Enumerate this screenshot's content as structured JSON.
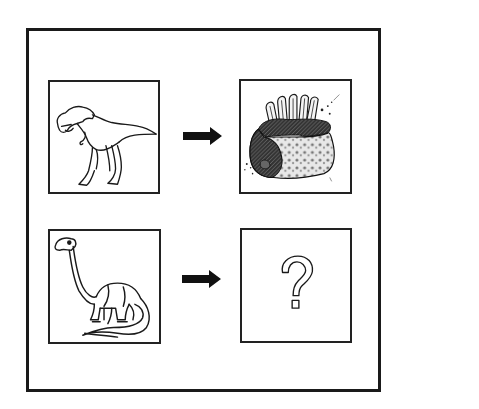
{
  "puzzle": {
    "type": "analogy",
    "rows": [
      {
        "left": {
          "label": "Tyrannosaurus rex (carnivore dinosaur)",
          "icon": "t-rex-icon"
        },
        "relation": "arrow-right",
        "right": {
          "label": "Rack of meat (ribs)",
          "icon": "meat-icon"
        }
      },
      {
        "left": {
          "label": "Brontosaurus (herbivore dinosaur)",
          "icon": "brontosaurus-icon"
        },
        "relation": "arrow-right",
        "right": {
          "label": "?",
          "icon": "question-mark-icon"
        }
      }
    ],
    "unknown_symbol": "?"
  },
  "colors": {
    "stroke": "#1a1a1a",
    "background": "#ffffff"
  }
}
